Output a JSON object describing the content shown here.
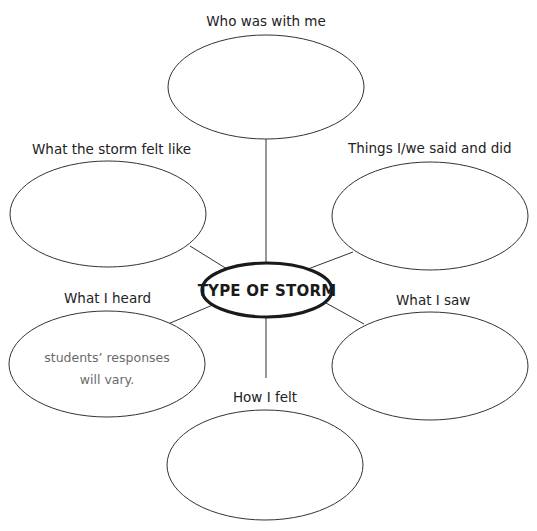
{
  "diagram": {
    "type": "web-organizer",
    "center": {
      "label": "TYPE OF STORM"
    },
    "nodes": [
      {
        "id": "top",
        "label": "Who was with me",
        "content": ""
      },
      {
        "id": "upper-left",
        "label": "What the storm felt like",
        "content": ""
      },
      {
        "id": "upper-right",
        "label": "Things I/we said and did",
        "content": ""
      },
      {
        "id": "lower-left",
        "label": "What I heard",
        "content_line1": "students’ responses",
        "content_line2": "will vary."
      },
      {
        "id": "lower-right",
        "label": "What I saw",
        "content": ""
      },
      {
        "id": "bottom",
        "label": "How I felt",
        "content": ""
      }
    ]
  },
  "colors": {
    "background": "#ffffff",
    "stroke": "#333333",
    "hub_stroke": "#1a1a1a",
    "label_text": "#222222",
    "sample_text": "#6a6a6a"
  }
}
